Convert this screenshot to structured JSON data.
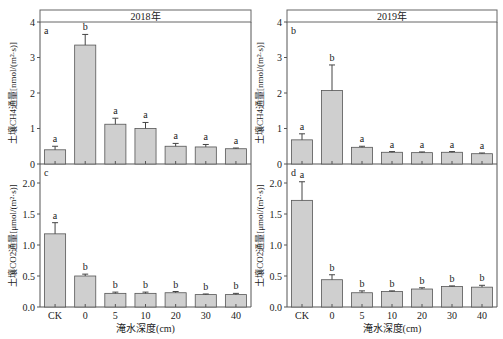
{
  "figure": {
    "x_axis_title": "淹水深度(cm)",
    "categories": [
      "CK",
      "0",
      "5",
      "10",
      "20",
      "30",
      "40"
    ],
    "bar_color": "#cfcfcf",
    "bar_edge_color": "#555555"
  },
  "chart_data": [
    {
      "type": "bar",
      "panel": "a",
      "title": "2018年",
      "xlabel": "淹水深度(cm)",
      "ylabel": "土壤CH4通量[nmol/(m²·s)]",
      "ylim": [
        0,
        4
      ],
      "yticks": [
        0,
        1,
        2,
        3,
        4
      ],
      "categories": [
        "CK",
        "0",
        "5",
        "10",
        "20",
        "30",
        "40"
      ],
      "values": [
        0.4,
        3.35,
        1.12,
        1.0,
        0.5,
        0.48,
        0.43
      ],
      "errors": [
        0.1,
        0.3,
        0.17,
        0.17,
        0.08,
        0.07,
        0.02
      ],
      "letters": [
        "a",
        "b",
        "a",
        "a",
        "a",
        "a",
        "a"
      ]
    },
    {
      "type": "bar",
      "panel": "b",
      "title": "2019年",
      "xlabel": "淹水深度(cm)",
      "ylabel": "土壤CH4通量[nmol/(m²·s)]",
      "ylim": [
        0,
        4
      ],
      "yticks": [
        0,
        1,
        2,
        3,
        4
      ],
      "categories": [
        "CK",
        "0",
        "5",
        "10",
        "20",
        "30",
        "40"
      ],
      "values": [
        0.68,
        2.07,
        0.47,
        0.33,
        0.32,
        0.33,
        0.29
      ],
      "errors": [
        0.17,
        0.72,
        0.03,
        0.02,
        0.02,
        0.02,
        0.02
      ],
      "letters": [
        "a",
        "b",
        "a",
        "a",
        "a",
        "a",
        "a"
      ]
    },
    {
      "type": "bar",
      "panel": "c",
      "title": "",
      "xlabel": "淹水深度(cm)",
      "ylabel": "土壤CO2通量[μmol/(m²·s)]",
      "ylim": [
        0,
        2.3
      ],
      "yticks": [
        0.0,
        0.5,
        1.0,
        1.5,
        2.0
      ],
      "categories": [
        "CK",
        "0",
        "5",
        "10",
        "20",
        "30",
        "40"
      ],
      "values": [
        1.18,
        0.5,
        0.22,
        0.22,
        0.23,
        0.2,
        0.2
      ],
      "errors": [
        0.18,
        0.03,
        0.02,
        0.02,
        0.02,
        0.01,
        0.02
      ],
      "letters": [
        "a",
        "b",
        "b",
        "b",
        "b",
        "b",
        "b"
      ]
    },
    {
      "type": "bar",
      "panel": "d",
      "title": "",
      "xlabel": "淹水深度(cm)",
      "ylabel": "土壤CO2通量[μmol/(m²·s)]",
      "ylim": [
        0,
        2.3
      ],
      "yticks": [
        0.0,
        0.5,
        1.0,
        1.5,
        2.0
      ],
      "categories": [
        "CK",
        "0",
        "5",
        "10",
        "20",
        "30",
        "40"
      ],
      "values": [
        1.72,
        0.44,
        0.23,
        0.25,
        0.29,
        0.33,
        0.32
      ],
      "errors": [
        0.3,
        0.08,
        0.03,
        0.01,
        0.02,
        0.01,
        0.03
      ],
      "letters": [
        "a",
        "b",
        "b",
        "b",
        "b",
        "b",
        "b"
      ]
    }
  ]
}
